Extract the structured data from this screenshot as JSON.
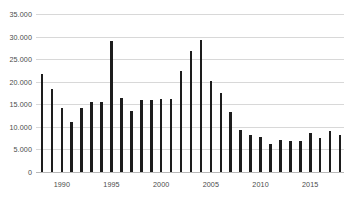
{
  "chart_data": {
    "type": "bar",
    "title": "",
    "subtitle": "",
    "xlabel": "",
    "ylabel": "",
    "grid": true,
    "legend": false,
    "ylim": [
      0,
      35000
    ],
    "ytick_labels": [
      "35.000",
      "30.000",
      "25.000",
      "20.000",
      "15.000",
      "10.000",
      "5.000",
      "0"
    ],
    "ytick_values": [
      35000,
      30000,
      25000,
      20000,
      15000,
      10000,
      5000,
      0
    ],
    "xtick_labels": [
      "1990",
      "1995",
      "2000",
      "2005",
      "2010",
      "2015"
    ],
    "xtick_values": [
      1990,
      1995,
      2000,
      2005,
      2010,
      2015
    ],
    "bar_color": "#1d1d1d",
    "grid_color": "#d8d8d8",
    "background_color": "#ffffff",
    "categories": [
      "1988",
      "1989",
      "1990",
      "1991",
      "1992",
      "1993",
      "1994",
      "1995",
      "1996",
      "1997",
      "1998",
      "1999",
      "2000",
      "2001",
      "2002",
      "2003",
      "2004",
      "2005",
      "2006",
      "2007",
      "2008",
      "2009",
      "2010",
      "2011",
      "2012",
      "2013",
      "2014",
      "2015",
      "2016",
      "2017",
      "2018"
    ],
    "values": [
      21800,
      18400,
      14200,
      11100,
      14200,
      15400,
      15400,
      29000,
      16400,
      13500,
      16000,
      15900,
      16100,
      16100,
      22400,
      26900,
      29200,
      20200,
      17400,
      13400,
      9400,
      8100,
      7800,
      6200,
      7200,
      6800,
      6900,
      8700,
      7500,
      9000,
      8100
    ]
  }
}
